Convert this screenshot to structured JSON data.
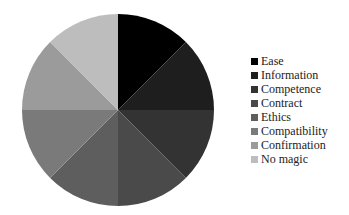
{
  "chart_data": {
    "type": "pie",
    "title": "",
    "categories": [
      "Ease",
      "Information",
      "Competence",
      "Contract",
      "Ethics",
      "Compatibility",
      "Confirmation",
      "No magic"
    ],
    "values": [
      12.5,
      12.5,
      12.5,
      12.5,
      12.5,
      12.5,
      12.5,
      12.5
    ],
    "colors": [
      "#000000",
      "#1e1e1e",
      "#333333",
      "#4a4a4a",
      "#5e5e5e",
      "#7a7a7a",
      "#9b9b9b",
      "#bdbdbd"
    ],
    "start_angle": "12 o'clock",
    "direction": "clockwise",
    "legend_position": "right"
  },
  "legend": {
    "items": [
      {
        "label": "Ease",
        "color": "#000000"
      },
      {
        "label": "Information",
        "color": "#1e1e1e"
      },
      {
        "label": "Competence",
        "color": "#333333"
      },
      {
        "label": "Contract",
        "color": "#4a4a4a"
      },
      {
        "label": "Ethics",
        "color": "#5e5e5e"
      },
      {
        "label": "Compatibility",
        "color": "#7a7a7a"
      },
      {
        "label": "Confirmation",
        "color": "#9b9b9b"
      },
      {
        "label": "No magic",
        "color": "#bdbdbd"
      }
    ]
  }
}
